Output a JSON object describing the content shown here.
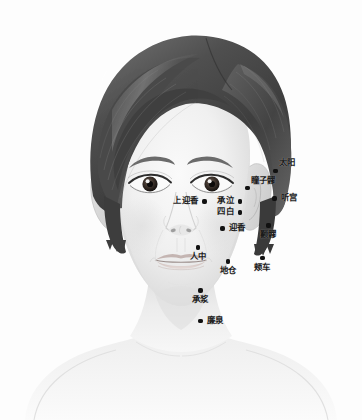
{
  "diagram": {
    "width": 362,
    "height": 420,
    "background_color": "#fdfdfd",
    "style": "grayscale pencil/airbrush illustration",
    "point_marker_color": "#111111",
    "label_text_color": "#1b1b1b",
    "hair_color": "#555555",
    "skin_color": "#f2f2f2"
  },
  "acupoints": [
    {
      "id": "taiyang",
      "label": "太阳",
      "x": 275.5,
      "y": 171.0,
      "label_pos": "above-right",
      "label_dx": 4,
      "label_dy": -12
    },
    {
      "id": "tongziliao",
      "label": "瞳子髎",
      "x": 247.5,
      "y": 188.0,
      "label_pos": "above-right",
      "label_dx": 5,
      "label_dy": -11
    },
    {
      "id": "tinggong",
      "label": "听宫",
      "x": 274.5,
      "y": 198.5,
      "label_pos": "right",
      "label_dx": 5,
      "label_dy": -4.5
    },
    {
      "id": "shangyingxiang",
      "label": "上迎香",
      "x": 204.5,
      "y": 201.5,
      "label_pos": "left",
      "label_dx": -6,
      "label_dy": -4.5
    },
    {
      "id": "chengqi",
      "label": "承泣",
      "x": 240.0,
      "y": 201.5,
      "label_pos": "left",
      "label_dx": -6,
      "label_dy": -4.5
    },
    {
      "id": "sibai",
      "label": "四白",
      "x": 240.0,
      "y": 212.5,
      "label_pos": "left",
      "label_dx": -6,
      "label_dy": -4.5
    },
    {
      "id": "yingxiang",
      "label": "迎香",
      "x": 222.5,
      "y": 228.5,
      "label_pos": "right",
      "label_dx": 5,
      "label_dy": -4.5
    },
    {
      "id": "quanliao",
      "label": "颧髎",
      "x": 268.5,
      "y": 225.5,
      "label_pos": "below",
      "label_dx": 0,
      "label_dy": 4
    },
    {
      "id": "renzhong",
      "label": "人中",
      "x": 198.0,
      "y": 247.5,
      "label_pos": "below",
      "label_dx": 0,
      "label_dy": 4
    },
    {
      "id": "dicang",
      "label": "地仓",
      "x": 228.0,
      "y": 261.5,
      "label_pos": "below",
      "label_dx": 0,
      "label_dy": 4
    },
    {
      "id": "jiache",
      "label": "颊车",
      "x": 262.5,
      "y": 258.0,
      "label_pos": "below",
      "label_dx": 0,
      "label_dy": 4
    },
    {
      "id": "chengjiang",
      "label": "承浆",
      "x": 200.5,
      "y": 290.5,
      "label_pos": "below",
      "label_dx": 0,
      "label_dy": 4
    },
    {
      "id": "lianquan",
      "label": "廉泉",
      "x": 200.5,
      "y": 321.0,
      "label_pos": "right",
      "label_dx": 4,
      "label_dy": -4.5
    }
  ]
}
